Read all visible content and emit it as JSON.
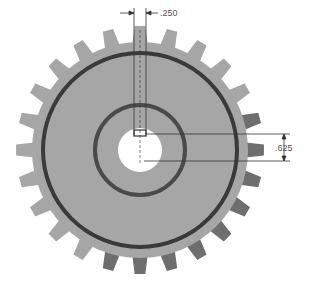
{
  "drawing": {
    "title": "Spur gear with keyway",
    "gear": {
      "center": [
        140,
        150
      ],
      "teeth": 24,
      "tip_radius": 124,
      "root_radius": 108,
      "pitch_ring_radius": 97,
      "hub_ring_radius": 45,
      "bore_radius": 22,
      "colors": {
        "body": "#a6a6a6",
        "tooth_shade": "#6e6e6e",
        "pitch_ring": "#3a3a3a",
        "hub_ring": "#4a4a4a",
        "bore": "#ffffff",
        "dim_line": "#333333"
      }
    },
    "dimensions": {
      "keyway_width": {
        "label": ".250"
      },
      "keyway_depth": {
        "label": ".625"
      }
    }
  }
}
